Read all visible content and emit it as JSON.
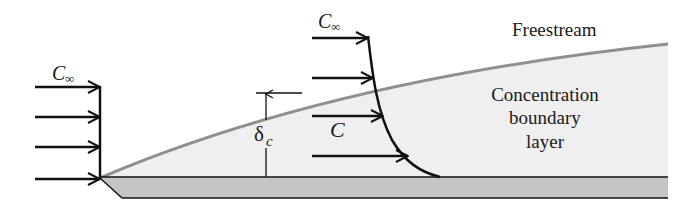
{
  "diagram": {
    "labels": {
      "freestream": "Freestream",
      "region_line1": "Concentration",
      "region_line2": "boundary",
      "region_line3": "layer",
      "c_inf_left": "C",
      "c_inf_left_sub": "∞",
      "c_inf_right": "C",
      "c_inf_right_sub": "∞",
      "c_local": "C",
      "delta": "δ",
      "delta_sub": "c"
    },
    "colors": {
      "boundary_fill": "#efefef",
      "boundary_edge": "#8f8f8f",
      "plate_fill": "#c4c4c4",
      "ink": "#111111"
    },
    "left_profile": {
      "x_line": 100,
      "arrows_y": [
        87,
        117,
        147,
        179
      ],
      "arrow_start_x": 35
    },
    "right_profile": {
      "arrows": [
        {
          "y": 38,
          "x_end": 368
        },
        {
          "y": 78,
          "x_end": 373
        },
        {
          "y": 116,
          "x_end": 383
        },
        {
          "y": 156,
          "x_end": 408
        }
      ],
      "arrow_start_x": 312
    }
  }
}
